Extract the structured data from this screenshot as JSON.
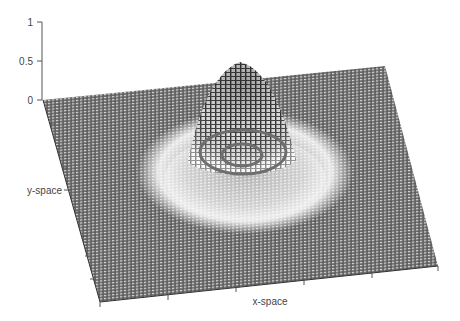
{
  "figure": {
    "type": "3d-surface-mesh",
    "z_axis": {
      "ticks": [
        "1",
        "0.5",
        "0"
      ],
      "tick_values": [
        1,
        0.5,
        0
      ]
    },
    "y_axis": {
      "label": "y-space"
    },
    "x_axis": {
      "label": "x-space"
    },
    "peak_height": 0.5,
    "contour_rings": 2,
    "colors": {
      "background": "#ffffff",
      "mesh_dark": "#5a5a5a",
      "mesh_light": "#9a9a9a",
      "halo": "#f2f2f2",
      "contour": "#6e6e6e",
      "axis": "#555555",
      "text": "#444444"
    }
  }
}
